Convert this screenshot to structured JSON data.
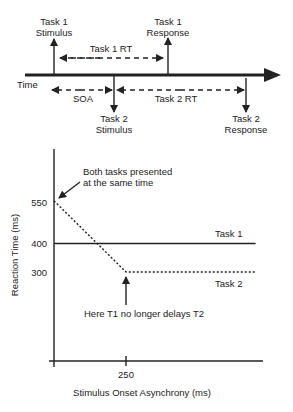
{
  "timeline": {
    "time_label": "Time",
    "task1_stimulus": {
      "line1": "Task 1",
      "line2": "Stimulus"
    },
    "task1_response": {
      "line1": "Task 1",
      "line2": "Response"
    },
    "task2_stimulus": {
      "line1": "Task 2",
      "line2": "Stimulus"
    },
    "task2_response": {
      "line1": "Task 2",
      "line2": "Response"
    },
    "task1_rt_label": "Task 1 RT",
    "soa_label": "SOA",
    "task2_rt_label": "Task 2 RT"
  },
  "plot": {
    "annotation_top": {
      "line1": "Both tasks presented",
      "line2": "at the same time"
    },
    "annotation_bottom": "Here T1 no longer delays T2",
    "series_labels": {
      "task1": "Task 1",
      "task2": "Task 2"
    }
  },
  "chart_data": {
    "type": "line",
    "title": "",
    "xlabel": "Stimulus Onset Asynchrony (ms)",
    "ylabel": "Reaction Time (ms)",
    "x_ticks": [
      250
    ],
    "y_ticks": [
      550,
      400,
      300
    ],
    "xlim": [
      0,
      725
    ],
    "ylim": [
      0,
      740
    ],
    "grid": false,
    "legend": "inline labels",
    "series": [
      {
        "name": "Task 1",
        "style": "solid",
        "x": [
          0,
          700
        ],
        "y": [
          400,
          400
        ]
      },
      {
        "name": "Task 2",
        "style": "dotted",
        "x": [
          0,
          250,
          700
        ],
        "y": [
          550,
          300,
          300
        ]
      }
    ],
    "annotations": [
      {
        "text": "Both tasks presented at the same time",
        "x": 0,
        "y": 550
      },
      {
        "text": "Here T1 no longer delays T2",
        "x": 250,
        "y": 300
      }
    ]
  }
}
